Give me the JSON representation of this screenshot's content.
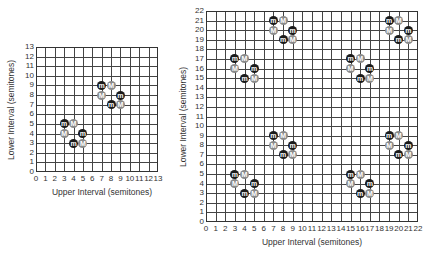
{
  "chart_data": [
    {
      "type": "scatter",
      "title": "",
      "xlabel": "Upper Interval (semitones)",
      "ylabel": "Lower Interval (semitones)",
      "xlim": [
        0,
        13
      ],
      "ylim": [
        0,
        13
      ],
      "grid": true,
      "xticks": [
        0,
        1,
        2,
        3,
        4,
        5,
        6,
        7,
        8,
        9,
        10,
        11,
        12,
        13
      ],
      "yticks": [
        0,
        1,
        2,
        3,
        4,
        5,
        6,
        7,
        8,
        9,
        10,
        11,
        12,
        13
      ],
      "legend": null,
      "series": [
        {
          "name": "m",
          "color": "#1a1a1a",
          "points": [
            [
              3,
              5
            ],
            [
              5,
              4
            ],
            [
              4,
              3
            ],
            [
              7,
              9
            ],
            [
              9,
              8
            ],
            [
              8,
              7
            ]
          ]
        },
        {
          "name": "M",
          "color": "#8a8a8a",
          "points": [
            [
              4,
              5
            ],
            [
              3,
              4
            ],
            [
              5,
              3
            ],
            [
              8,
              9
            ],
            [
              7,
              8
            ],
            [
              9,
              7
            ]
          ]
        }
      ]
    },
    {
      "type": "scatter",
      "title": "",
      "xlabel": "Upper Interval (semitones)",
      "ylabel": "Lower Interval (semitones)",
      "xlim": [
        0,
        22
      ],
      "ylim": [
        0,
        22
      ],
      "grid": true,
      "xticks": [
        0,
        1,
        2,
        3,
        4,
        5,
        6,
        7,
        8,
        9,
        10,
        11,
        12,
        13,
        14,
        15,
        16,
        17,
        18,
        19,
        20,
        21,
        22
      ],
      "yticks": [
        0,
        1,
        2,
        3,
        4,
        5,
        6,
        7,
        8,
        9,
        10,
        11,
        12,
        13,
        14,
        15,
        16,
        17,
        18,
        19,
        20,
        21,
        22
      ],
      "legend": null,
      "series": [
        {
          "name": "m",
          "color": "#1a1a1a",
          "points": [
            [
              3,
              5
            ],
            [
              5,
              4
            ],
            [
              4,
              3
            ],
            [
              7,
              9
            ],
            [
              9,
              8
            ],
            [
              8,
              7
            ],
            [
              3,
              17
            ],
            [
              5,
              16
            ],
            [
              4,
              15
            ],
            [
              7,
              21
            ],
            [
              9,
              20
            ],
            [
              8,
              19
            ],
            [
              15,
              5
            ],
            [
              17,
              4
            ],
            [
              16,
              3
            ],
            [
              19,
              9
            ],
            [
              21,
              8
            ],
            [
              20,
              7
            ],
            [
              15,
              17
            ],
            [
              17,
              16
            ],
            [
              16,
              15
            ],
            [
              19,
              21
            ],
            [
              21,
              20
            ],
            [
              20,
              19
            ]
          ]
        },
        {
          "name": "M",
          "color": "#8a8a8a",
          "points": [
            [
              4,
              5
            ],
            [
              3,
              4
            ],
            [
              5,
              3
            ],
            [
              8,
              9
            ],
            [
              7,
              8
            ],
            [
              9,
              7
            ],
            [
              4,
              17
            ],
            [
              3,
              16
            ],
            [
              5,
              15
            ],
            [
              8,
              21
            ],
            [
              7,
              20
            ],
            [
              9,
              19
            ],
            [
              16,
              5
            ],
            [
              15,
              4
            ],
            [
              17,
              3
            ],
            [
              20,
              9
            ],
            [
              19,
              8
            ],
            [
              21,
              7
            ],
            [
              16,
              17
            ],
            [
              15,
              16
            ],
            [
              17,
              15
            ],
            [
              20,
              21
            ],
            [
              19,
              20
            ],
            [
              21,
              19
            ]
          ]
        }
      ]
    }
  ],
  "charts": {
    "small": {
      "xlabel": "Upper Interval (semitones)",
      "ylabel": "Lower Interval (semitones)"
    },
    "large": {
      "xlabel": "Upper Interval (semitones)",
      "ylabel": "Lower Interval (semitones)"
    }
  }
}
